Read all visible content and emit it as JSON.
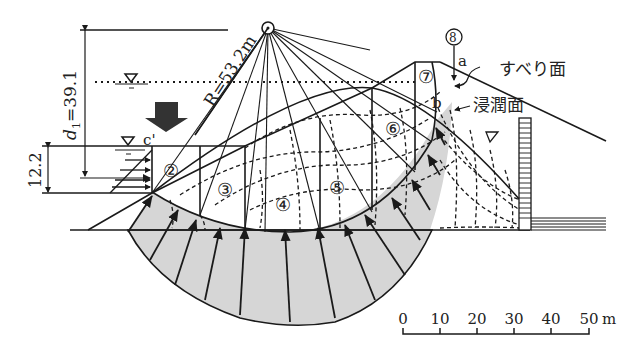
{
  "diagram": {
    "type": "slope stability analysis (circular slip, method of slices)",
    "radius_label": "R=53.2m",
    "depth_label": "d",
    "depth_subscript": "1",
    "depth_value": "=39.1",
    "height_label": "12.2",
    "point_labels": {
      "a": "a",
      "b": "b",
      "c": "c'"
    },
    "slices": [
      {
        "id": "2",
        "glyph": "②"
      },
      {
        "id": "3",
        "glyph": "③"
      },
      {
        "id": "4",
        "glyph": "④"
      },
      {
        "id": "5",
        "glyph": "⑤"
      },
      {
        "id": "6",
        "glyph": "⑥"
      },
      {
        "id": "7",
        "glyph": "⑦"
      },
      {
        "id": "8",
        "glyph": "⑧"
      }
    ],
    "annotations": {
      "slip_surface": "すべり面",
      "seepage_surface": "浸潤面"
    },
    "water_symbol": "▽",
    "scale": {
      "ticks": [
        "0",
        "10",
        "20",
        "30",
        "40",
        "50"
      ],
      "unit": "m"
    },
    "colors": {
      "line": "#1a1a1a",
      "pressure_fill": "#d4d4d4",
      "background": "#ffffff",
      "arrow_down": "#333333"
    }
  }
}
